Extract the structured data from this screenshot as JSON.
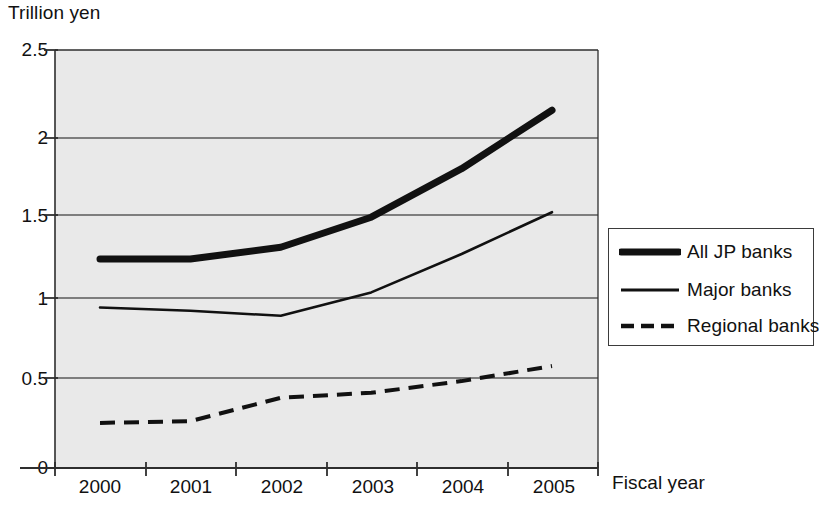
{
  "chart_data": {
    "type": "line",
    "title": "",
    "ylabel": "Trillion yen",
    "xlabel": "Fiscal year",
    "categories": [
      "2000",
      "2001",
      "2002",
      "2003",
      "2004",
      "2005"
    ],
    "x": [
      2000,
      2001,
      2002,
      2003,
      2004,
      2005
    ],
    "ylim": [
      0,
      2.5
    ],
    "yticks": [
      "0",
      "0.5",
      "1",
      "1.5",
      "2",
      "2.5"
    ],
    "ytick_values": [
      0,
      0.5,
      1,
      1.5,
      2,
      2.5
    ],
    "grid": "horizontal",
    "legend_position": "right",
    "series": [
      {
        "name": "All JP banks",
        "style": "thick-solid",
        "color": "#111111",
        "values": [
          1.25,
          1.25,
          1.32,
          1.5,
          1.79,
          2.14
        ]
      },
      {
        "name": "Major banks",
        "style": "thin-solid",
        "color": "#111111",
        "values": [
          0.96,
          0.94,
          0.91,
          1.05,
          1.28,
          1.53
        ]
      },
      {
        "name": "Regional banks",
        "style": "dashed",
        "color": "#111111",
        "values": [
          0.27,
          0.28,
          0.42,
          0.45,
          0.52,
          0.61
        ]
      }
    ]
  },
  "legend": {
    "items": [
      {
        "label": "All JP banks",
        "swatch": "thick-solid-line-swatch"
      },
      {
        "label": "Major banks",
        "swatch": "thin-solid-line-swatch"
      },
      {
        "label": "Regional banks",
        "swatch": "dashed-line-swatch"
      }
    ]
  }
}
